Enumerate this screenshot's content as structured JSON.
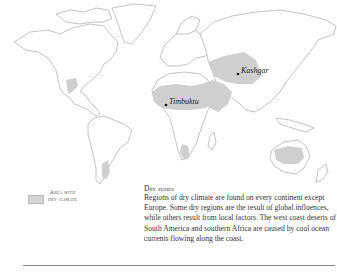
{
  "map": {
    "title": "World map of dry climate regions",
    "colors": {
      "dry_area": "#cfcfcf",
      "coastline": "#9a9a9a",
      "background": "#ffffff"
    },
    "cities": [
      {
        "name": "Timbuktu",
        "x": 166,
        "y": 105
      },
      {
        "name": "Kashgar",
        "x": 238,
        "y": 74
      }
    ]
  },
  "legend": {
    "label_line1": "Area with",
    "label_line2": "dry climate"
  },
  "caption": {
    "title": "Dry zones",
    "body": "Regions of dry climate are found on every continent except Europe. Some dry regions are the result of global influences, while others result from local factors. The west coast deserts of South America and southern Africa are caused by cool ocean currents flowing along the coast."
  }
}
